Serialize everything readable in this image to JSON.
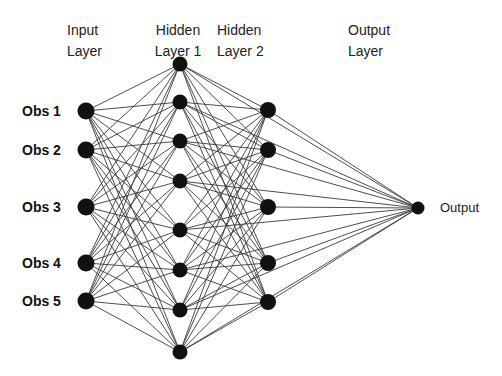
{
  "diagram": {
    "layers": [
      {
        "id": "input",
        "title_line1": "Input",
        "title_line2": "Layer",
        "node_count": 5
      },
      {
        "id": "hidden1",
        "title_line1": "Hidden",
        "title_line2": "Layer 1",
        "node_count": 8
      },
      {
        "id": "hidden2",
        "title_line1": "Hidden",
        "title_line2": "Layer 2",
        "node_count": 5
      },
      {
        "id": "output",
        "title_line1": "Output",
        "title_line2": "Layer",
        "node_count": 1
      }
    ],
    "input_labels": [
      "Obs 1",
      "Obs 2",
      "Obs 3",
      "Obs 4",
      "Obs 5"
    ],
    "output_label": "Output",
    "connections": [
      {
        "from": "input",
        "to": "hidden1",
        "type": "full"
      },
      {
        "from": "hidden1",
        "to": "hidden2",
        "type": "full"
      },
      {
        "from": "hidden2",
        "to": "output",
        "type": "full"
      },
      {
        "from": "hidden1",
        "to": "output",
        "type": "full"
      }
    ],
    "colors": {
      "node": "#111111",
      "edge": "#3a3a3a",
      "text": "#222222"
    }
  }
}
